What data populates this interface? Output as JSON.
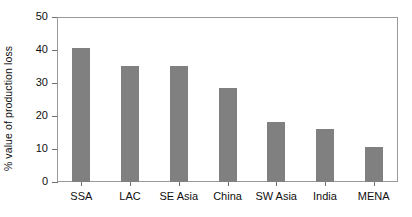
{
  "chart_data": {
    "type": "bar",
    "title": "",
    "xlabel": "",
    "ylabel": "% value of production loss",
    "categories": [
      "SSA",
      "LAC",
      "SE Asia",
      "China",
      "SW Asia",
      "India",
      "MENA"
    ],
    "values": [
      40.5,
      35.3,
      35.3,
      28.5,
      18.1,
      16.1,
      10.5
    ],
    "ylim": [
      0,
      50
    ],
    "yticks": [
      0,
      10,
      20,
      30,
      40,
      50
    ],
    "ytick_labels": [
      "0",
      "10",
      "20",
      "30",
      "40",
      "50"
    ],
    "grid": false,
    "legend": null,
    "bar_color": "#808080",
    "frame_color": "#9a9a9a",
    "background_color": "#ffffff"
  }
}
